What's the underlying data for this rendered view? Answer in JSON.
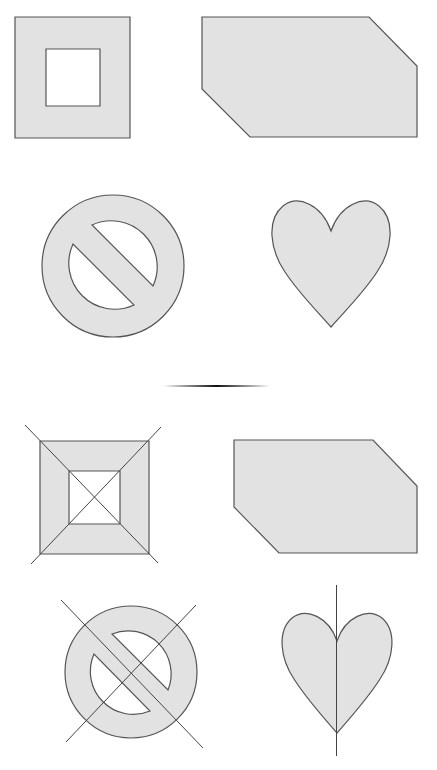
{
  "figure": {
    "background": "#ffffff",
    "fill_color": "#e2e2e2",
    "stroke_color": "#555555",
    "guide_color": "#444444"
  },
  "top_group": {
    "shapes": [
      {
        "kind": "square-with-square-hole",
        "label": "framed square"
      },
      {
        "kind": "chamfered-hexagon",
        "label": "hexagon"
      },
      {
        "kind": "prohibition-sign",
        "label": "no symbol"
      },
      {
        "kind": "heart",
        "label": "heart"
      }
    ]
  },
  "divider": {
    "kind": "tapered-horizontal-line"
  },
  "bottom_group": {
    "shapes": [
      {
        "kind": "square-with-square-hole",
        "label": "framed square with diagonals",
        "guides": "two diagonal lines through corners"
      },
      {
        "kind": "chamfered-hexagon",
        "label": "hexagon",
        "guides": "none"
      },
      {
        "kind": "prohibition-sign",
        "label": "no symbol with crossing lines",
        "guides": "two crossing diagonal lines"
      },
      {
        "kind": "heart",
        "label": "heart with vertical axis",
        "guides": "vertical symmetry line"
      }
    ]
  }
}
